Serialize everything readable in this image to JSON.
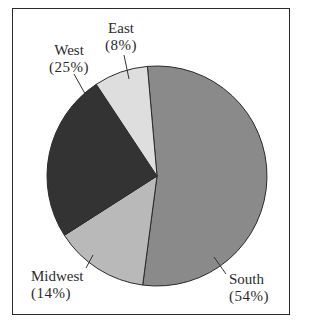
{
  "chart_data": {
    "type": "pie",
    "title": "",
    "start_angle_deg": -5,
    "direction": "clockwise",
    "slices": [
      {
        "label": "South",
        "pct_label": "(54%)",
        "value": 54,
        "color": "#8a8a8a"
      },
      {
        "label": "Midwest",
        "pct_label": "(14%)",
        "value": 14,
        "color": "#b9b9b9"
      },
      {
        "label": "West",
        "pct_label": "(25%)",
        "value": 25,
        "color": "#333333"
      },
      {
        "label": "East",
        "pct_label": "(8%)",
        "value": 8,
        "color": "#dedede"
      }
    ],
    "legend": "none",
    "labels_outside_with_leader_lines": true
  },
  "labels": {
    "east": {
      "name": "East",
      "pct": "(8%)"
    },
    "west": {
      "name": "West",
      "pct": "(25%)"
    },
    "midwest": {
      "name": "Midwest",
      "pct": "(14%)"
    },
    "south": {
      "name": "South",
      "pct": "(54%)"
    }
  }
}
